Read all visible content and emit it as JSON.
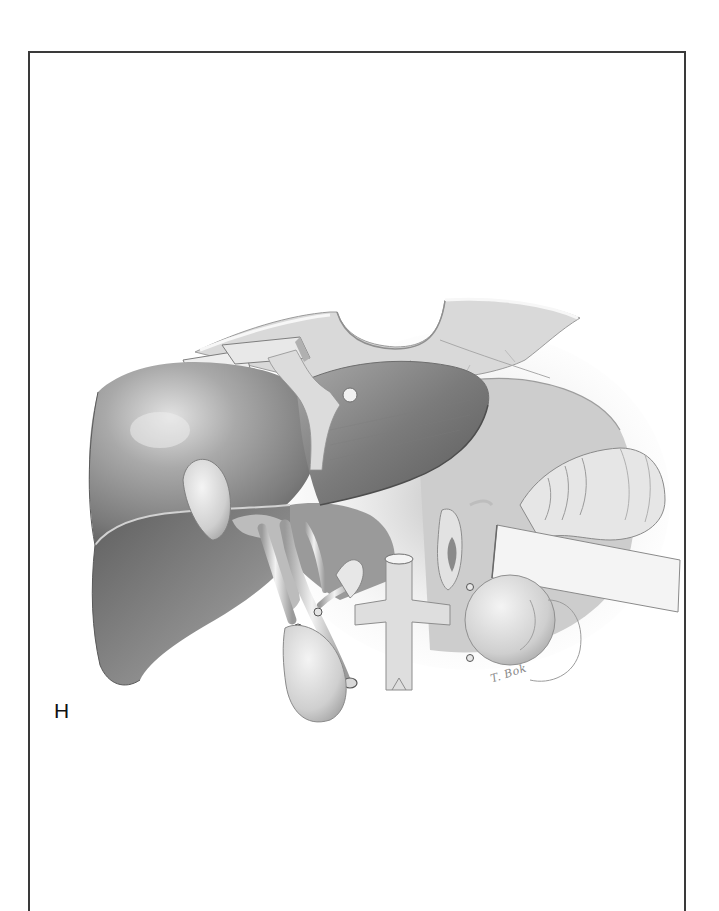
{
  "figure": {
    "panel_label": "H",
    "signature": "T. Bok",
    "colors": {
      "frame": "#3a3a3a",
      "background": "#ffffff",
      "tissue_dark": "#6e6e6e",
      "tissue_mid": "#a6a6a6",
      "tissue_light": "#dcdcdc"
    }
  }
}
